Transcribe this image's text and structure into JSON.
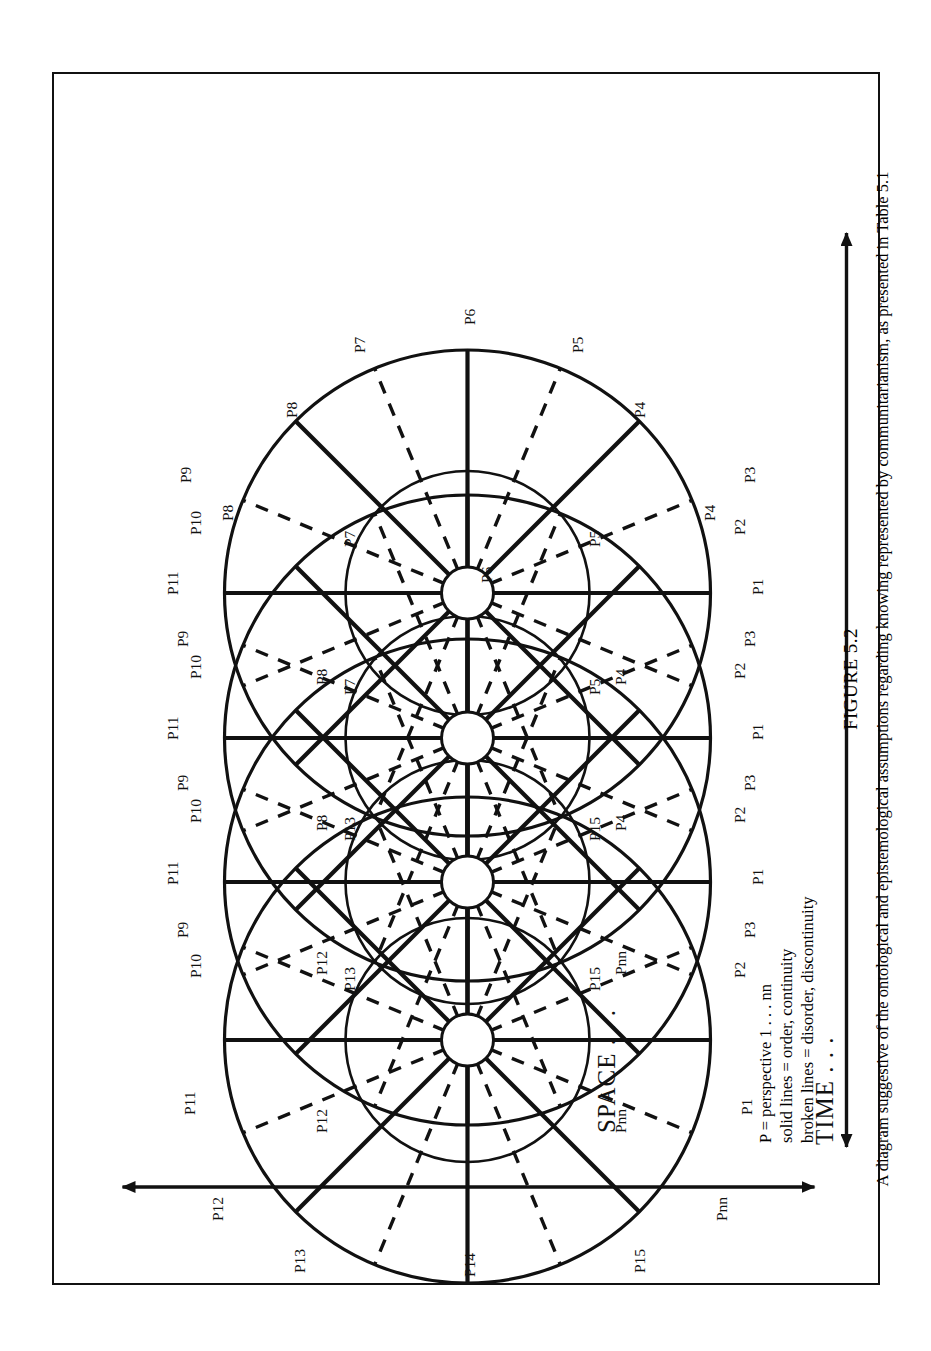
{
  "figure": {
    "number": "FIGURE 5.2",
    "caption": "A diagram suggestive of the ontological and epistemological assumptions regarding knowing represented by communitarianism, as presented in Table 5.1"
  },
  "axes": {
    "horizontal_label": "SPACE . . .",
    "vertical_label": "TIME . . .",
    "horizontal_arrow": "double-headed-horizontal-arrow",
    "vertical_arrow": "double-headed-vertical-arrow"
  },
  "legend": {
    "lines": [
      "P = perspective 1 . . . nn",
      "solid lines = order, continuity",
      "broken lines = disorder, discontinuity"
    ]
  },
  "diagram": {
    "circle_count": 4,
    "hub_count": 4,
    "outer_labels_top": [
      "P5",
      "P6",
      "P7"
    ],
    "outer_labels_bottom": [
      "P15",
      "P14",
      "P13"
    ],
    "outer_labels_left_sequence": [
      "P4",
      "P3",
      "P2",
      "P3",
      "P1",
      "P2",
      "P3",
      "P1",
      "P2",
      "P3",
      "P1",
      "P2",
      "P1",
      "Pnn"
    ],
    "outer_labels_right_sequence": [
      "P8",
      "P9",
      "P10",
      "P9",
      "P11",
      "P10",
      "P9",
      "P11",
      "P10",
      "P9",
      "P11",
      "P10",
      "P11",
      "P12"
    ],
    "inner_labels": [
      "P4",
      "P4",
      "P4",
      "Pnn",
      "Pnn",
      "Pnn",
      "P8",
      "P8",
      "P8",
      "P12",
      "P12",
      "P12"
    ],
    "spoke_labels": [
      "P1",
      "P2",
      "P3",
      "P4",
      "P5",
      "P6",
      "P7",
      "P8",
      "P9",
      "P10",
      "P11",
      "P12",
      "P13",
      "P14",
      "P15",
      "Pnn"
    ],
    "line_styles": {
      "solid": "order, continuity",
      "broken": "disorder, discontinuity"
    },
    "colors": {
      "ink": "#111111",
      "paper": "#ffffff"
    }
  }
}
